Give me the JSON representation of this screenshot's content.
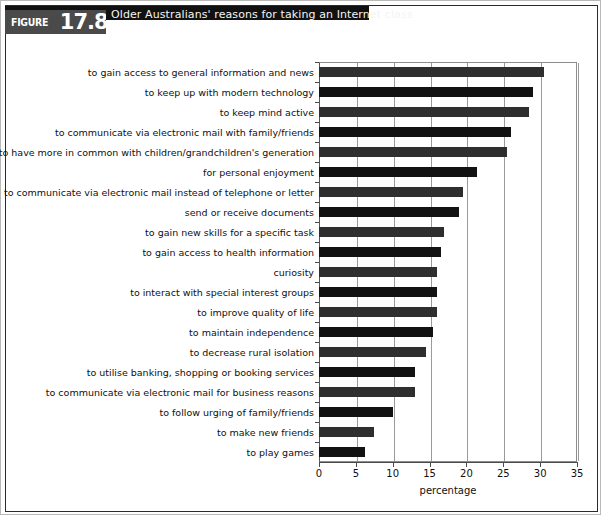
{
  "figure": {
    "tag_word": "FIGURE",
    "number": "17.8",
    "title": "Older Australians' reasons for taking an Internet class"
  },
  "chart_data": {
    "type": "bar",
    "orientation": "horizontal",
    "title": "Older Australians' reasons for taking an Internet class",
    "xlabel": "percentage",
    "ylabel": "",
    "xlim": [
      0,
      35
    ],
    "xticks": [
      0,
      5,
      10,
      15,
      20,
      25,
      30,
      35
    ],
    "grid": true,
    "legend": false,
    "categories": [
      "to gain access to general information and news",
      "to keep up with modern technology",
      "to keep mind active",
      "to communicate via electronic mail with family/friends",
      "to have more in common with children/grandchildren's generation",
      "for personal enjoyment",
      "to communicate via electronic mail instead of telephone or letter",
      "send or receive documents",
      "to gain new skills for a specific task",
      "to gain access to health information",
      "curiosity",
      "to interact with special interest groups",
      "to improve quality of life",
      "to maintain independence",
      "to decrease rural isolation",
      "to utilise banking, shopping or booking services",
      "to communicate via electronic mail for business reasons",
      "to follow urging of family/friends",
      "to make new friends",
      "to play games"
    ],
    "values": [
      30.5,
      29.0,
      28.5,
      26.0,
      25.5,
      21.5,
      19.5,
      19.0,
      17.0,
      16.5,
      16.0,
      16.0,
      16.0,
      15.5,
      14.5,
      13.0,
      13.0,
      10.0,
      7.5,
      6.2
    ]
  }
}
